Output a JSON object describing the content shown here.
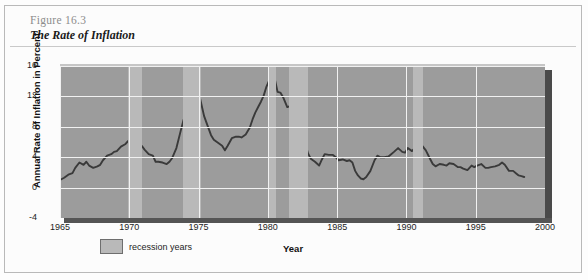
{
  "figure": {
    "number": "Figure 16.3",
    "title": "The Rate of Inflation"
  },
  "legend": {
    "recession_label": "recession years",
    "swatch_color": "#b9b9b9"
  },
  "colors": {
    "plot_background": "#9c9c9c",
    "recession_band": "#b9b9b9",
    "gridline": "#f1f1f1",
    "series_line": "#3a3a3a",
    "shadow": "#4a4a4a"
  },
  "chart_data": {
    "type": "line",
    "title": "The Rate of Inflation",
    "xlabel": "Year",
    "ylabel": "Annual Rate of Inflation in Percent",
    "xlim": [
      1965,
      2000
    ],
    "ylim": [
      -4,
      16
    ],
    "xticks": [
      1965,
      1970,
      1975,
      1980,
      1985,
      1990,
      1995,
      2000
    ],
    "yticks": [
      -4,
      0,
      4,
      8,
      12,
      16
    ],
    "grid": true,
    "legend_position": "below-axis-left",
    "legend_entries": [
      "recession years"
    ],
    "recession_bands": [
      {
        "start": 1969.9,
        "end": 1970.9
      },
      {
        "start": 1973.9,
        "end": 1975.2
      },
      {
        "start": 1980.0,
        "end": 1980.6
      },
      {
        "start": 1981.5,
        "end": 1982.9
      },
      {
        "start": 1990.5,
        "end": 1991.2
      }
    ],
    "series": [
      {
        "name": "Annual rate of inflation",
        "x": [
          1965.0,
          1965.3,
          1965.6,
          1965.9,
          1966.1,
          1966.4,
          1966.7,
          1966.9,
          1967.1,
          1967.4,
          1967.7,
          1967.9,
          1968.1,
          1968.4,
          1968.7,
          1968.9,
          1969.1,
          1969.4,
          1969.7,
          1969.9,
          1970.1,
          1970.4,
          1970.7,
          1970.9,
          1971.1,
          1971.4,
          1971.7,
          1971.9,
          1972.1,
          1972.4,
          1972.7,
          1972.9,
          1973.1,
          1973.4,
          1973.7,
          1973.9,
          1974.1,
          1974.3,
          1974.5,
          1974.7,
          1974.9,
          1975.1,
          1975.4,
          1975.7,
          1975.9,
          1976.1,
          1976.4,
          1976.7,
          1976.9,
          1977.1,
          1977.4,
          1977.7,
          1977.9,
          1978.1,
          1978.4,
          1978.7,
          1978.9,
          1979.1,
          1979.3,
          1979.5,
          1979.7,
          1979.9,
          1980.1,
          1980.3,
          1980.5,
          1980.7,
          1980.9,
          1981.1,
          1981.4,
          1981.7,
          1981.9,
          1982.1,
          1982.4,
          1982.7,
          1982.9,
          1983.1,
          1983.4,
          1983.7,
          1983.9,
          1984.1,
          1984.4,
          1984.7,
          1984.9,
          1985.1,
          1985.4,
          1985.7,
          1985.9,
          1986.1,
          1986.3,
          1986.5,
          1986.7,
          1986.9,
          1987.1,
          1987.4,
          1987.7,
          1987.9,
          1988.1,
          1988.4,
          1988.7,
          1988.9,
          1989.1,
          1989.4,
          1989.7,
          1989.9,
          1990.1,
          1990.4,
          1990.7,
          1990.9,
          1991.1,
          1991.4,
          1991.7,
          1991.9,
          1992.1,
          1992.4,
          1992.7,
          1992.9,
          1993.1,
          1993.4,
          1993.7,
          1993.9,
          1994.1,
          1994.4,
          1994.7,
          1994.9,
          1995.1,
          1995.4,
          1995.7,
          1995.9,
          1996.1,
          1996.4,
          1996.7,
          1996.9,
          1997.1,
          1997.4,
          1997.7,
          1997.9,
          1998.1,
          1998.3,
          1998.5
        ],
        "y": [
          1.0,
          1.3,
          1.7,
          1.9,
          2.6,
          3.3,
          3.0,
          3.4,
          2.9,
          2.6,
          2.8,
          3.0,
          3.6,
          4.2,
          4.4,
          4.7,
          4.8,
          5.4,
          5.7,
          6.1,
          6.2,
          5.9,
          5.6,
          5.5,
          5.0,
          4.4,
          4.2,
          3.4,
          3.4,
          3.3,
          3.1,
          3.4,
          3.9,
          5.2,
          7.4,
          8.8,
          10.0,
          10.7,
          11.5,
          12.3,
          12.1,
          11.8,
          9.4,
          7.9,
          6.9,
          6.3,
          5.9,
          5.5,
          4.9,
          5.5,
          6.5,
          6.7,
          6.7,
          6.6,
          7.0,
          7.9,
          9.0,
          9.9,
          10.6,
          11.3,
          12.1,
          13.3,
          14.1,
          14.8,
          14.3,
          12.6,
          12.5,
          11.9,
          10.6,
          10.8,
          9.6,
          8.4,
          6.6,
          5.8,
          4.5,
          3.8,
          3.4,
          2.9,
          3.7,
          4.4,
          4.3,
          4.3,
          4.0,
          3.6,
          3.7,
          3.5,
          3.6,
          3.3,
          2.2,
          1.6,
          1.2,
          1.1,
          1.4,
          2.2,
          3.6,
          4.2,
          4.0,
          4.0,
          4.1,
          4.4,
          4.7,
          5.2,
          4.7,
          4.6,
          5.2,
          4.8,
          5.4,
          6.3,
          5.6,
          4.9,
          3.8,
          3.1,
          2.8,
          3.1,
          3.0,
          2.9,
          3.2,
          3.1,
          2.7,
          2.7,
          2.5,
          2.3,
          2.9,
          2.7,
          2.9,
          3.1,
          2.6,
          2.6,
          2.7,
          2.8,
          3.0,
          3.3,
          3.0,
          2.2,
          2.2,
          1.9,
          1.6,
          1.5,
          1.4
        ]
      }
    ]
  }
}
